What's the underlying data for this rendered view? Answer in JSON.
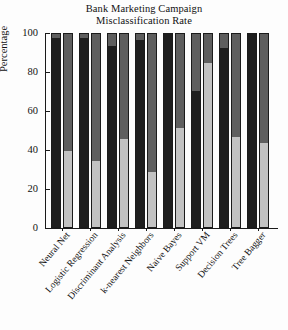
{
  "chart_data": {
    "type": "bar",
    "title": "Bank Marketing Campaign Misclassification Rate",
    "title_line1": "Bank Marketing Campaign",
    "title_line2": "Misclassification Rate",
    "xlabel": "",
    "ylabel": "Percentage",
    "ylim": [
      0,
      100
    ],
    "yticks": [
      0,
      20,
      40,
      60,
      80,
      100
    ],
    "ytick_labels": [
      "0",
      "20",
      "40",
      "60",
      "80",
      "100"
    ],
    "grid": false,
    "legend": "none",
    "stacked": true,
    "categories": [
      "Neural Net",
      "Logistic Regression",
      "Discriminant Analysis",
      "k-nearest Neighbors",
      "Naive Bayes",
      "Support VM",
      "Decision Trees",
      "Tree Bagger"
    ],
    "series": [
      {
        "name": "Bar 1 lower (dark)",
        "color": "#1e1e1e",
        "values": [
          97,
          97,
          93,
          96,
          100,
          70,
          92,
          100
        ]
      },
      {
        "name": "Bar 1 upper (medium gray)",
        "color": "#5e5e5e",
        "values": [
          3,
          3,
          7,
          4,
          0,
          30,
          8,
          0
        ]
      },
      {
        "name": "Bar 2 lower (light gray)",
        "color": "#c2c2c2",
        "values": [
          39,
          34,
          45,
          28,
          51,
          84,
          46,
          43
        ]
      },
      {
        "name": "Bar 2 upper (medium gray)",
        "color": "#5e5e5e",
        "values": [
          61,
          66,
          55,
          72,
          49,
          16,
          54,
          57
        ]
      }
    ]
  },
  "axis": {
    "y_title": "Percentage"
  }
}
